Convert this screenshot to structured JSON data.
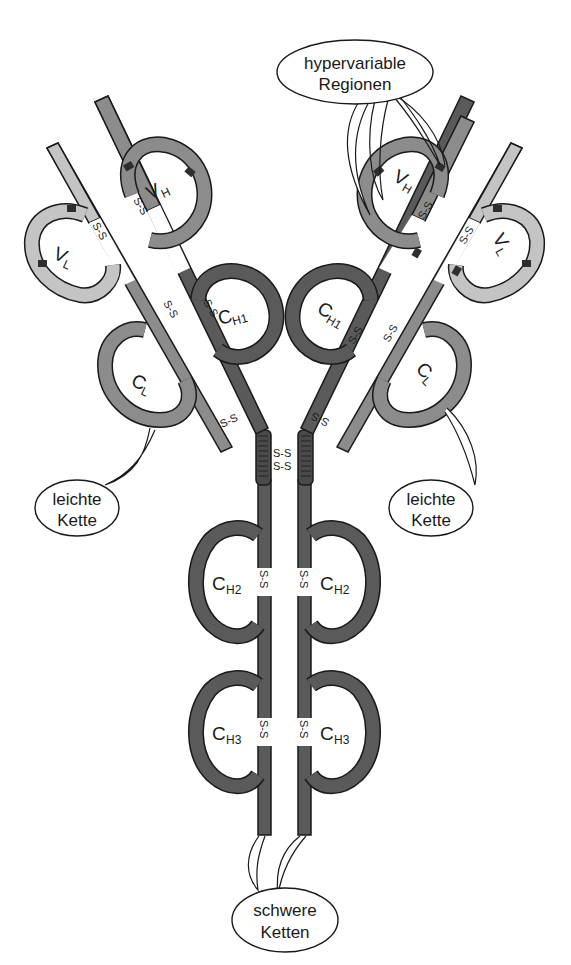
{
  "colors": {
    "heavy_dark": "#5a5a5a",
    "heavy_mid": "#8c8c8c",
    "light": "#c4c4c4",
    "hypervariable": "#2e2e2e",
    "outline": "#1a1a1a",
    "background": "#ffffff"
  },
  "domains": {
    "vh": {
      "main": "V",
      "sub": "H"
    },
    "vl": {
      "main": "V",
      "sub": "L"
    },
    "ch1": {
      "main": "C",
      "sub": "H1"
    },
    "cl": {
      "main": "C",
      "sub": "L"
    },
    "ch2": {
      "main": "C",
      "sub": "H2"
    },
    "ch3": {
      "main": "C",
      "sub": "H3"
    }
  },
  "disulfide_label": "S-S",
  "callouts": {
    "hypervariable": {
      "line1": "hypervariable",
      "line2": "Regionen"
    },
    "light_left": {
      "line1": "leichte",
      "line2": "Kette"
    },
    "light_right": {
      "line1": "leichte",
      "line2": "Kette"
    },
    "heavy": {
      "line1": "schwere",
      "line2": "Ketten"
    }
  }
}
